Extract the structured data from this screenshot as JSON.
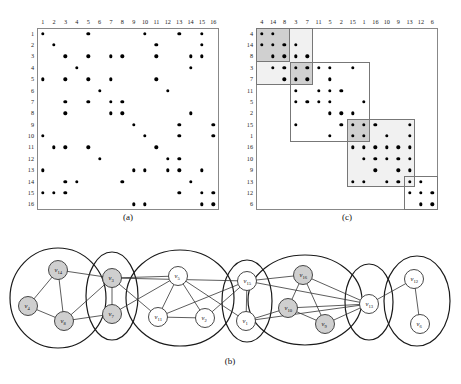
{
  "figure": {
    "captions": {
      "a": "(a)",
      "b": "(b)",
      "c": "(c)"
    }
  },
  "chart_data": [
    {
      "type": "heatmap",
      "name": "adjacency-matrix-original",
      "title": "(a)",
      "xlabel": "",
      "ylabel": "",
      "categories": [
        1,
        2,
        3,
        4,
        5,
        6,
        7,
        8,
        9,
        10,
        11,
        12,
        13,
        14,
        15,
        16
      ],
      "row_order": [
        1,
        2,
        3,
        4,
        5,
        6,
        7,
        8,
        9,
        10,
        11,
        12,
        13,
        14,
        15,
        16
      ],
      "col_order": [
        1,
        2,
        3,
        4,
        5,
        6,
        7,
        8,
        9,
        10,
        11,
        12,
        13,
        14,
        15,
        16
      ],
      "cells": [
        [
          1,
          1
        ],
        [
          1,
          5
        ],
        [
          1,
          10
        ],
        [
          1,
          13
        ],
        [
          1,
          15
        ],
        [
          2,
          2
        ],
        [
          2,
          11
        ],
        [
          2,
          15
        ],
        [
          3,
          3
        ],
        [
          3,
          5
        ],
        [
          3,
          7
        ],
        [
          3,
          8
        ],
        [
          3,
          11
        ],
        [
          3,
          14
        ],
        [
          3,
          15
        ],
        [
          4,
          4
        ],
        [
          4,
          14
        ],
        [
          5,
          1
        ],
        [
          5,
          3
        ],
        [
          5,
          5
        ],
        [
          5,
          7
        ],
        [
          5,
          11
        ],
        [
          6,
          6
        ],
        [
          6,
          12
        ],
        [
          7,
          3
        ],
        [
          7,
          5
        ],
        [
          7,
          7
        ],
        [
          7,
          8
        ],
        [
          8,
          3
        ],
        [
          8,
          7
        ],
        [
          8,
          8
        ],
        [
          8,
          14
        ],
        [
          9,
          9
        ],
        [
          9,
          13
        ],
        [
          9,
          16
        ],
        [
          10,
          1
        ],
        [
          10,
          10
        ],
        [
          10,
          13
        ],
        [
          10,
          16
        ],
        [
          11,
          2
        ],
        [
          11,
          3
        ],
        [
          11,
          5
        ],
        [
          11,
          11
        ],
        [
          12,
          6
        ],
        [
          12,
          12
        ],
        [
          12,
          13
        ],
        [
          13,
          1
        ],
        [
          13,
          9
        ],
        [
          13,
          10
        ],
        [
          13,
          12
        ],
        [
          13,
          13
        ],
        [
          13,
          15
        ],
        [
          14,
          3
        ],
        [
          14,
          4
        ],
        [
          14,
          8
        ],
        [
          14,
          14
        ],
        [
          15,
          1
        ],
        [
          15,
          2
        ],
        [
          15,
          3
        ],
        [
          15,
          13
        ],
        [
          15,
          15
        ],
        [
          15,
          16
        ],
        [
          16,
          9
        ],
        [
          16,
          10
        ],
        [
          16,
          15
        ],
        [
          16,
          16
        ]
      ]
    },
    {
      "type": "heatmap",
      "name": "adjacency-matrix-permuted",
      "title": "(c)",
      "xlabel": "",
      "ylabel": "",
      "categories": [
        4,
        14,
        8,
        3,
        7,
        11,
        5,
        2,
        15,
        1,
        16,
        10,
        9,
        13,
        12,
        6
      ],
      "row_order": [
        4,
        14,
        8,
        3,
        7,
        11,
        5,
        2,
        15,
        1,
        16,
        10,
        9,
        13,
        12,
        6
      ],
      "col_order": [
        4,
        14,
        8,
        3,
        7,
        11,
        5,
        2,
        15,
        1,
        16,
        10,
        9,
        13,
        12,
        6
      ],
      "cells": [
        [
          4,
          4
        ],
        [
          4,
          14
        ],
        [
          14,
          4
        ],
        [
          14,
          14
        ],
        [
          14,
          8
        ],
        [
          14,
          3
        ],
        [
          8,
          14
        ],
        [
          8,
          8
        ],
        [
          8,
          3
        ],
        [
          8,
          7
        ],
        [
          3,
          14
        ],
        [
          3,
          8
        ],
        [
          3,
          3
        ],
        [
          3,
          7
        ],
        [
          3,
          11
        ],
        [
          3,
          5
        ],
        [
          3,
          15
        ],
        [
          7,
          8
        ],
        [
          7,
          3
        ],
        [
          7,
          7
        ],
        [
          7,
          5
        ],
        [
          11,
          3
        ],
        [
          11,
          11
        ],
        [
          11,
          5
        ],
        [
          11,
          2
        ],
        [
          5,
          3
        ],
        [
          5,
          7
        ],
        [
          5,
          11
        ],
        [
          5,
          5
        ],
        [
          5,
          1
        ],
        [
          2,
          5
        ],
        [
          2,
          2
        ],
        [
          2,
          15
        ],
        [
          15,
          3
        ],
        [
          15,
          2
        ],
        [
          15,
          15
        ],
        [
          15,
          1
        ],
        [
          15,
          16
        ],
        [
          15,
          13
        ],
        [
          1,
          5
        ],
        [
          1,
          15
        ],
        [
          1,
          1
        ],
        [
          1,
          10
        ],
        [
          1,
          13
        ],
        [
          16,
          15
        ],
        [
          16,
          1
        ],
        [
          16,
          16
        ],
        [
          16,
          10
        ],
        [
          16,
          9
        ],
        [
          16,
          13
        ],
        [
          10,
          1
        ],
        [
          10,
          16
        ],
        [
          10,
          10
        ],
        [
          10,
          9
        ],
        [
          10,
          13
        ],
        [
          9,
          16
        ],
        [
          9,
          9
        ],
        [
          9,
          13
        ],
        [
          13,
          15
        ],
        [
          13,
          1
        ],
        [
          13,
          10
        ],
        [
          13,
          9
        ],
        [
          13,
          13
        ],
        [
          13,
          12
        ],
        [
          12,
          13
        ],
        [
          12,
          12
        ],
        [
          12,
          6
        ],
        [
          6,
          12
        ],
        [
          6,
          6
        ]
      ],
      "blocks": [
        {
          "name": "cluster-1",
          "start": 0,
          "size": 5,
          "shade": "light"
        },
        {
          "name": "cluster-1-core",
          "start": 0,
          "size": 3,
          "shade": "dark"
        },
        {
          "name": "cluster-2",
          "start": 3,
          "size": 7,
          "shade": "plain"
        },
        {
          "name": "cluster-2-core",
          "start": 3,
          "size": 2,
          "shade": "dark"
        },
        {
          "name": "cluster-3",
          "start": 8,
          "size": 6,
          "shade": "light"
        },
        {
          "name": "cluster-3-core",
          "start": 8,
          "size": 2,
          "shade": "dark"
        },
        {
          "name": "cluster-4",
          "start": 13,
          "size": 3,
          "shade": "plain"
        }
      ]
    }
  ],
  "graph": {
    "name": "clustered-graph",
    "nodes": [
      {
        "id": "v4",
        "label": "v",
        "sub": "4",
        "x": 28,
        "y": 70,
        "fill": "#cfcfcf"
      },
      {
        "id": "v14",
        "label": "v",
        "sub": "14",
        "x": 58,
        "y": 34,
        "fill": "#cfcfcf"
      },
      {
        "id": "v8",
        "label": "v",
        "sub": "8",
        "x": 64,
        "y": 85,
        "fill": "#cfcfcf"
      },
      {
        "id": "v3",
        "label": "v",
        "sub": "3",
        "x": 112,
        "y": 42,
        "fill": "#cfcfcf"
      },
      {
        "id": "v7",
        "label": "v",
        "sub": "7",
        "x": 112,
        "y": 78,
        "fill": "#cfcfcf"
      },
      {
        "id": "v5",
        "label": "v",
        "sub": "5",
        "x": 178,
        "y": 40,
        "fill": "#ffffff"
      },
      {
        "id": "v11",
        "label": "v",
        "sub": "11",
        "x": 158,
        "y": 81,
        "fill": "#ffffff"
      },
      {
        "id": "v2",
        "label": "v",
        "sub": "2",
        "x": 205,
        "y": 82,
        "fill": "#ffffff"
      },
      {
        "id": "v15",
        "label": "v",
        "sub": "15",
        "x": 247,
        "y": 45,
        "fill": "#ffffff"
      },
      {
        "id": "v1",
        "label": "v",
        "sub": "1",
        "x": 246,
        "y": 85,
        "fill": "#ffffff"
      },
      {
        "id": "v16",
        "label": "v",
        "sub": "16",
        "x": 303,
        "y": 39,
        "fill": "#cfcfcf"
      },
      {
        "id": "v10",
        "label": "v",
        "sub": "10",
        "x": 288,
        "y": 72,
        "fill": "#cfcfcf"
      },
      {
        "id": "v9",
        "label": "v",
        "sub": "9",
        "x": 325,
        "y": 88,
        "fill": "#cfcfcf"
      },
      {
        "id": "v13",
        "label": "v",
        "sub": "13",
        "x": 369,
        "y": 68,
        "fill": "#ffffff"
      },
      {
        "id": "v12",
        "label": "v",
        "sub": "12",
        "x": 414,
        "y": 43,
        "fill": "#ffffff"
      },
      {
        "id": "v6",
        "label": "v",
        "sub": "6",
        "x": 420,
        "y": 88,
        "fill": "#ffffff"
      }
    ],
    "edges": [
      [
        "v4",
        "v14"
      ],
      [
        "v4",
        "v8"
      ],
      [
        "v14",
        "v8"
      ],
      [
        "v14",
        "v3"
      ],
      [
        "v8",
        "v3"
      ],
      [
        "v8",
        "v7"
      ],
      [
        "v3",
        "v7"
      ],
      [
        "v3",
        "v5"
      ],
      [
        "v3",
        "v11"
      ],
      [
        "v3",
        "v15"
      ],
      [
        "v7",
        "v5"
      ],
      [
        "v5",
        "v11"
      ],
      [
        "v5",
        "v2"
      ],
      [
        "v5",
        "v1"
      ],
      [
        "v11",
        "v2"
      ],
      [
        "v11",
        "v15"
      ],
      [
        "v2",
        "v15"
      ],
      [
        "v15",
        "v1"
      ],
      [
        "v15",
        "v13"
      ],
      [
        "v15",
        "v16"
      ],
      [
        "v1",
        "v10"
      ],
      [
        "v1",
        "v13"
      ],
      [
        "v16",
        "v10"
      ],
      [
        "v16",
        "v9"
      ],
      [
        "v16",
        "v13"
      ],
      [
        "v10",
        "v9"
      ],
      [
        "v10",
        "v13"
      ],
      [
        "v9",
        "v13"
      ],
      [
        "v13",
        "v12"
      ],
      [
        "v12",
        "v6"
      ]
    ],
    "clusters": [
      {
        "name": "cluster-ellipse-1",
        "cx": 58,
        "cy": 62,
        "rx": 48,
        "ry": 50
      },
      {
        "name": "cluster-ellipse-2",
        "cx": 112,
        "cy": 60,
        "rx": 26,
        "ry": 44
      },
      {
        "name": "cluster-ellipse-3",
        "cx": 180,
        "cy": 62,
        "rx": 54,
        "ry": 48
      },
      {
        "name": "cluster-ellipse-4",
        "cx": 247,
        "cy": 65,
        "rx": 25,
        "ry": 41
      },
      {
        "name": "cluster-ellipse-5",
        "cx": 305,
        "cy": 64,
        "rx": 57,
        "ry": 45
      },
      {
        "name": "cluster-ellipse-6",
        "cx": 369,
        "cy": 66,
        "rx": 24,
        "ry": 38
      },
      {
        "name": "cluster-ellipse-7",
        "cx": 417,
        "cy": 65,
        "rx": 33,
        "ry": 45
      }
    ]
  }
}
